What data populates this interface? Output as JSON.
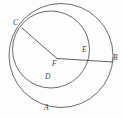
{
  "figure": {
    "kind": "geometry-diagram",
    "canvas": {
      "width": 123,
      "height": 118
    },
    "background_color": "#fdfdfd",
    "stroke_color": "#5a5a5a",
    "label_color": "#3d3d3d",
    "circles": [
      {
        "name": "outer-circle",
        "cx": 61,
        "cy": 55.5,
        "r": 52
      },
      {
        "name": "inner-circle",
        "cx": 51,
        "cy": 49.5,
        "r": 38.5
      }
    ],
    "segments": [
      {
        "name": "segment-cf",
        "from": "C",
        "to": "F",
        "x1": 22,
        "y1": 28,
        "x2": 57,
        "y2": 58.5
      },
      {
        "name": "segment-fb",
        "from": "F",
        "to": "B",
        "x1": 57,
        "y1": 58.5,
        "x2": 113,
        "y2": 62
      }
    ],
    "labels": [
      {
        "name": "point-label-c",
        "text": "C",
        "x": 13,
        "y": 19
      },
      {
        "name": "point-label-f",
        "text": "F",
        "x": 52,
        "y": 60
      },
      {
        "name": "point-label-e",
        "text": "E",
        "x": 82,
        "y": 46
      },
      {
        "name": "point-label-b",
        "text": "B",
        "x": 113,
        "y": 54
      },
      {
        "name": "point-label-d",
        "text": "D",
        "x": 45,
        "y": 73
      },
      {
        "name": "point-label-a",
        "text": "A",
        "x": 44,
        "y": 104
      }
    ]
  }
}
